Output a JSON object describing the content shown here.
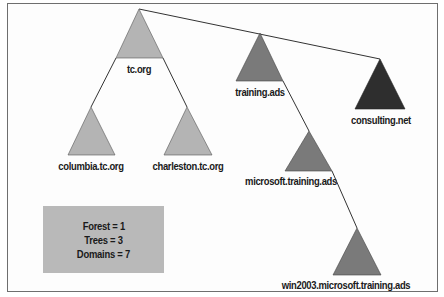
{
  "diagram": {
    "type": "active-directory-forest",
    "colors": {
      "light_gray": "#b4b4b4",
      "medium_gray": "#7a7a7a",
      "dark": "#2e2e2e",
      "stats_box": "#b9b9b9",
      "line": "#333333"
    },
    "nodes": [
      {
        "id": "tc-org",
        "label": "tc.org",
        "shade": "light_gray"
      },
      {
        "id": "columbia",
        "label": "columbia.tc.org",
        "shade": "light_gray"
      },
      {
        "id": "charleston",
        "label": "charleston.tc.org",
        "shade": "light_gray"
      },
      {
        "id": "training-ads",
        "label": "training.ads",
        "shade": "medium_gray"
      },
      {
        "id": "microsoft-training",
        "label": "microsoft.training.ads",
        "shade": "medium_gray"
      },
      {
        "id": "win2003",
        "label": "win2003.microsoft.training.ads",
        "shade": "medium_gray"
      },
      {
        "id": "consulting-net",
        "label": "consulting.net",
        "shade": "dark"
      }
    ],
    "edges": [
      {
        "from": "tc-org",
        "to": "training-ads",
        "kind": "tree-root-link"
      },
      {
        "from": "training-ads",
        "to": "consulting-net",
        "kind": "tree-root-link"
      },
      {
        "from": "tc-org",
        "to": "columbia",
        "kind": "parent-child"
      },
      {
        "from": "tc-org",
        "to": "charleston",
        "kind": "parent-child"
      },
      {
        "from": "training-ads",
        "to": "microsoft-training",
        "kind": "parent-child"
      },
      {
        "from": "microsoft-training",
        "to": "win2003",
        "kind": "parent-child"
      }
    ],
    "stats": {
      "forest": "Forest = 1",
      "trees": "Trees = 3",
      "domains": "Domains = 7"
    }
  }
}
